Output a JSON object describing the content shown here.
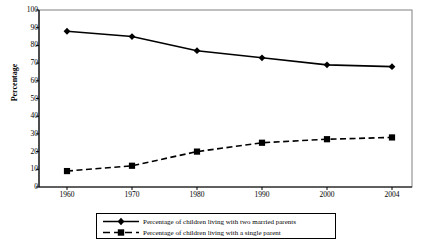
{
  "chart_data": {
    "type": "line",
    "title": "",
    "xlabel": "",
    "ylabel": "Percentage",
    "categories": [
      "1960",
      "1970",
      "1980",
      "1990",
      "2000",
      "2004"
    ],
    "x": [
      1960,
      1970,
      1980,
      1990,
      2000,
      2004
    ],
    "ylim": [
      0,
      100
    ],
    "yticks": [
      0,
      10,
      20,
      30,
      40,
      50,
      60,
      70,
      80,
      90,
      100
    ],
    "grid": false,
    "legend_position": "bottom",
    "series": [
      {
        "name": "Percentage of children living with two married parents",
        "values": [
          88,
          85,
          77,
          73,
          69,
          68
        ],
        "marker": "diamond",
        "line_style": "solid",
        "color": "#000000"
      },
      {
        "name": "Percentage of children living with a single parent",
        "values": [
          9,
          12,
          20,
          25,
          27,
          28
        ],
        "marker": "square",
        "line_style": "dashed",
        "color": "#000000"
      }
    ]
  },
  "axis": {
    "y_title": "Percentage",
    "y_tick_labels": [
      "100",
      "90",
      "80",
      "70",
      "60",
      "50",
      "40",
      "30",
      "20",
      "10",
      "0"
    ],
    "x_tick_labels": [
      "1960",
      "1970",
      "1980",
      "1990",
      "2000",
      "2004"
    ]
  },
  "legend": {
    "entries": [
      {
        "label": "Percentage of children living with two married parents"
      },
      {
        "label": "Percentage of children living with a single parent"
      }
    ]
  },
  "colors": {
    "ink": "#000000",
    "frame": "#808080",
    "background": "#ffffff"
  }
}
